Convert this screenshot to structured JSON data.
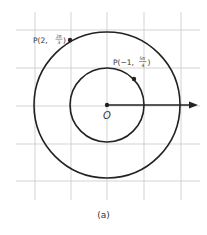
{
  "figure": {
    "caption": "(a)",
    "origin_label": "O",
    "grid": {
      "x_lines": [
        35,
        71,
        107,
        144,
        181
      ],
      "y_lines": [
        30,
        68,
        106,
        144,
        181
      ],
      "extent": {
        "x1": 16,
        "x2": 200,
        "y1": 12,
        "y2": 200
      },
      "color": "#c8c8c8"
    },
    "center": {
      "x": 107,
      "y": 105
    },
    "circles": [
      {
        "name": "outer-circle",
        "radius_units": 2,
        "r": 73
      },
      {
        "name": "inner-circle",
        "radius_units": 1,
        "r": 37
      }
    ],
    "polar_axis": {
      "x1": 107,
      "x2": 197,
      "y": 105
    },
    "points": [
      {
        "name": "point-p1",
        "label_prefix": "P(2, ",
        "frac_num": "2π",
        "frac_den": "3",
        "label_suffix": ")",
        "x": 70,
        "y": 40
      },
      {
        "name": "point-p2",
        "label_prefix": "P(−1, ",
        "frac_num": "5π",
        "frac_den": "4",
        "label_suffix": ")",
        "x": 134,
        "y": 79
      }
    ],
    "stroke_color": "#222222"
  }
}
